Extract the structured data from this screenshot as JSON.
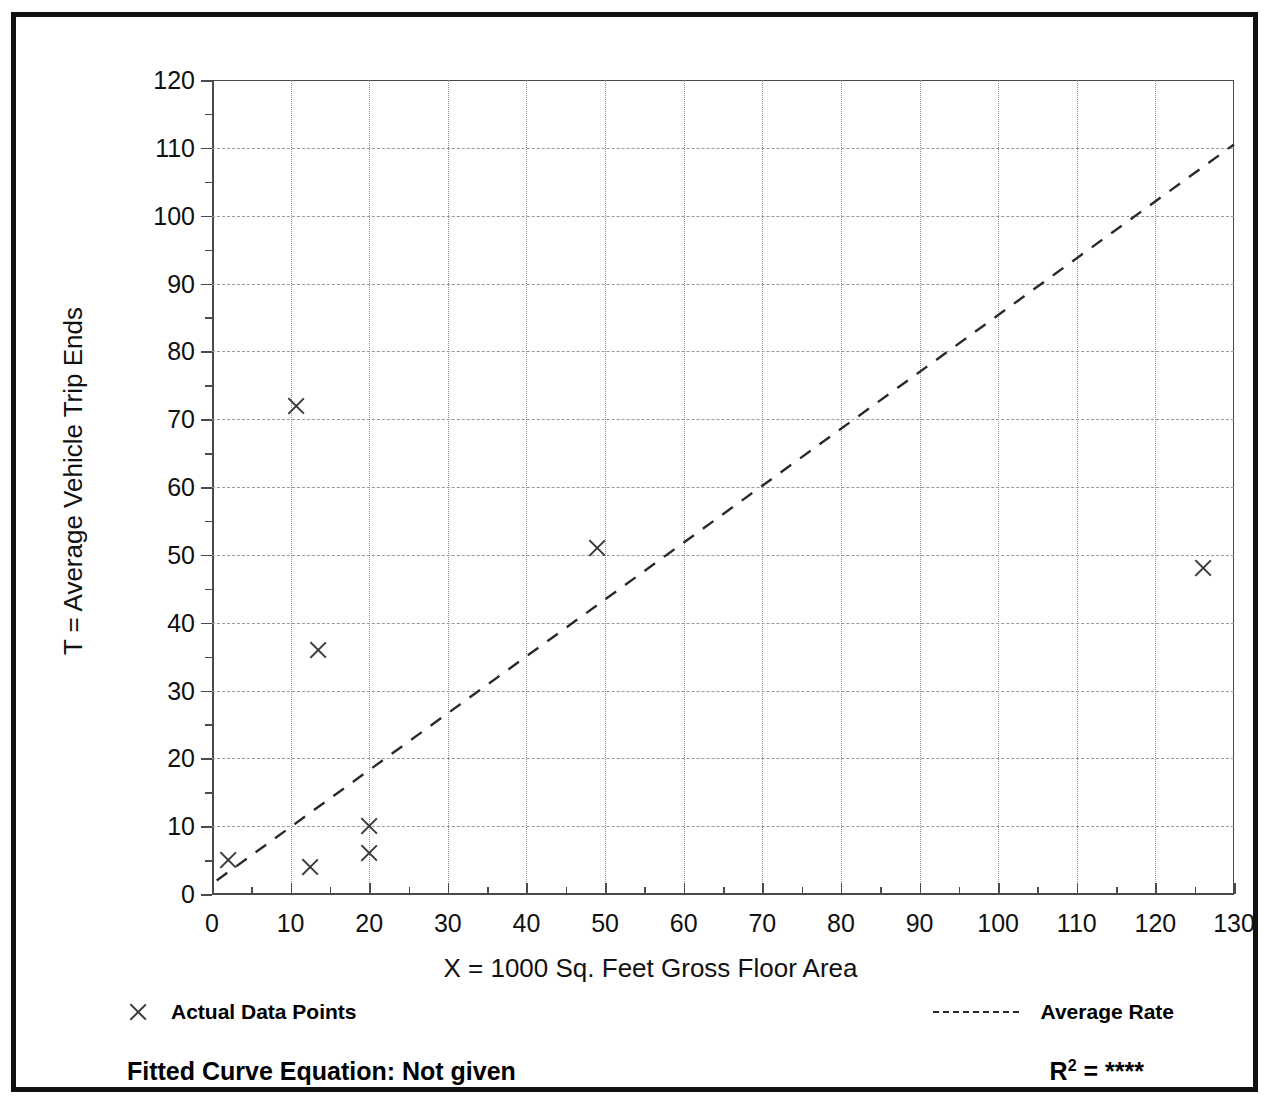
{
  "chart_data": {
    "type": "scatter",
    "title": "",
    "xlabel": "X = 1000 Sq. Feet Gross Floor Area",
    "ylabel": "T = Average Vehicle Trip Ends",
    "xlim": [
      0,
      130
    ],
    "ylim": [
      0,
      120
    ],
    "x_ticks": [
      0,
      10,
      20,
      30,
      40,
      50,
      60,
      70,
      80,
      90,
      100,
      110,
      120,
      130
    ],
    "y_ticks": [
      0,
      10,
      20,
      30,
      40,
      50,
      60,
      70,
      80,
      90,
      100,
      110,
      120
    ],
    "x_minor_step": 5,
    "y_minor_step": 5,
    "grid": true,
    "legend_position": "below-plot",
    "series": [
      {
        "name": "Actual Data Points",
        "type": "scatter",
        "marker": "x",
        "points": [
          {
            "x": 2.0,
            "y": 5
          },
          {
            "x": 10.7,
            "y": 72
          },
          {
            "x": 13.5,
            "y": 36
          },
          {
            "x": 12.5,
            "y": 4
          },
          {
            "x": 20.0,
            "y": 10
          },
          {
            "x": 20.0,
            "y": 6
          },
          {
            "x": 49.0,
            "y": 51
          },
          {
            "x": 126.0,
            "y": 48
          }
        ]
      },
      {
        "name": "Average Rate",
        "type": "line",
        "style": "dashed",
        "points": [
          {
            "x": 0.6,
            "y": 2.0
          },
          {
            "x": 130.0,
            "y": 110.5
          }
        ]
      }
    ]
  },
  "legend": {
    "data_points_label": "Actual Data Points",
    "average_rate_label": "Average Rate",
    "marker_icon": "x-marker-icon",
    "line_icon": "dashed-line-icon"
  },
  "footer": {
    "equation_label": "Fitted Curve Equation:  Not given",
    "r_squared_prefix": "R",
    "r_squared_exponent": "2",
    "r_squared_value": "= ****"
  },
  "colors": {
    "frame": "#111111",
    "axis": "#4a4a4a",
    "grid": "#8f8f8f",
    "marker": "#3a3a3a",
    "line": "#2a2a2a",
    "background": "#ffffff"
  }
}
